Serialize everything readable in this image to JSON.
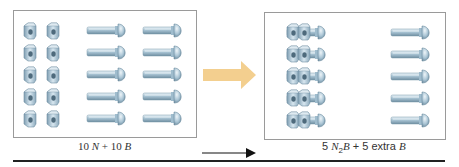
{
  "figure": {
    "type": "stoichiometry-analogy-diagram",
    "reactants": {
      "label_parts": [
        {
          "text": "10 ",
          "style": "normal"
        },
        {
          "text": "N",
          "style": "italic"
        },
        {
          "text": " + 10 ",
          "style": "normal"
        },
        {
          "text": "B",
          "style": "italic"
        }
      ],
      "nuts_count": 10,
      "bolts_count": 10,
      "nut_columns": 2,
      "bolt_columns": 2,
      "rows": 5
    },
    "products": {
      "label_parts": [
        {
          "text": "5 ",
          "style": "normal"
        },
        {
          "text": "N",
          "style": "italic"
        },
        {
          "text": "2",
          "style": "sub"
        },
        {
          "text": "B",
          "style": "italic"
        },
        {
          "text": " + 5 extra ",
          "style": "normal"
        },
        {
          "text": "B",
          "style": "italic"
        }
      ],
      "assembled_count": 5,
      "extra_bolts_count": 5,
      "rows": 5
    },
    "colors": {
      "metal_light": "#cfe0ea",
      "metal_mid": "#9fbccd",
      "metal_dark": "#5f7f93",
      "arrow_fill": "#f3cf8f",
      "box_border": "#9a9a9a",
      "rule": "#222222",
      "text": "#333333"
    }
  }
}
